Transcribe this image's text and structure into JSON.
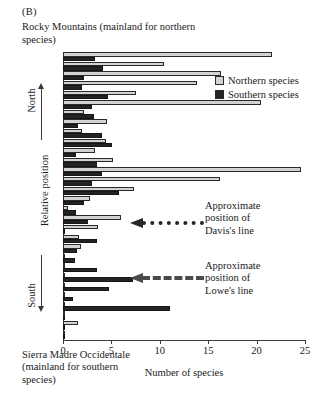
{
  "panel": {
    "letter": "(B)"
  },
  "captions": {
    "top": "Rocky Mountains (mainland for northern species)",
    "bottom": "Sierra Madre Occidentale (mainland for southern species)"
  },
  "legend": {
    "northern_label": "Northern species",
    "southern_label": "Southern species",
    "northern_color": "#d2d2d2",
    "southern_color": "#242424"
  },
  "annotations": {
    "davis": {
      "text": "Approximate\nposition of\nDavis's line",
      "style": "dotted",
      "color": "#262626"
    },
    "lowe": {
      "text": "Approximate\nposition of\nLowe's line",
      "style": "dashed",
      "color": "#4a4a4a"
    }
  },
  "axes": {
    "y_title": "Relative position",
    "y_top_direction": "North",
    "y_bottom_direction": "South",
    "x_title": "Number of species",
    "x_ticks": [
      0,
      5,
      10,
      15,
      20,
      25
    ]
  },
  "chart_data": {
    "type": "bar",
    "orientation": "horizontal",
    "title": "Rocky Mountains (mainland for northern species)",
    "xlabel": "Number of species",
    "ylabel": "Relative position",
    "xlim": [
      0,
      25
    ],
    "grid": false,
    "legend_position": "top-right",
    "categories": [
      "1",
      "2",
      "3",
      "4",
      "5",
      "6",
      "7",
      "8",
      "9",
      "10",
      "11",
      "12",
      "13",
      "14",
      "15",
      "16",
      "17",
      "18",
      "19",
      "20",
      "21",
      "22",
      "23",
      "24",
      "25",
      "26",
      "27",
      "28",
      "29",
      "30"
    ],
    "series": [
      {
        "name": "Northern species",
        "color": "#d2d2d2",
        "values": [
          21.6,
          10.4,
          16.3,
          13.8,
          7.5,
          20.5,
          2.2,
          4.5,
          2.0,
          4.4,
          3.3,
          5.2,
          24.6,
          16.2,
          7.3,
          2.8,
          0.5,
          6.0,
          3.6,
          1.7,
          1.9,
          0.2,
          0.2,
          0.2,
          0.2,
          0.2,
          0.2,
          0.2,
          1.6,
          0.2
        ]
      },
      {
        "name": "Southern species",
        "color": "#242424",
        "values": [
          3.3,
          4.1,
          2.2,
          2.0,
          4.6,
          3.0,
          3.2,
          1.5,
          4.0,
          5.1,
          1.3,
          3.5,
          4.0,
          3.0,
          5.8,
          2.2,
          1.3,
          2.6,
          0.2,
          3.5,
          1.4,
          1.2,
          3.5,
          7.2,
          4.8,
          1.0,
          11.1,
          0.2,
          0.2,
          0.2
        ]
      }
    ]
  }
}
